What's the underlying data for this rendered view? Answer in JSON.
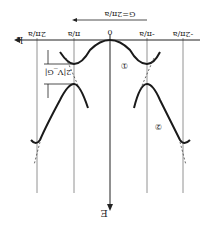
{
  "diagram": {
    "orientation_deg": 180,
    "axes": {
      "k_label": "k",
      "e_label": "E",
      "k_ticks": [
        "-2π/a",
        "-π/a",
        "0",
        "π/a",
        "2π/a"
      ]
    },
    "reciprocal_vector_label": "G=2π/a",
    "gap_label": "2|V_G|",
    "band_labels": [
      "①",
      "②"
    ],
    "colors": {
      "line": "#1a1a1a",
      "guide": "#777777",
      "background": "#ffffff"
    }
  }
}
